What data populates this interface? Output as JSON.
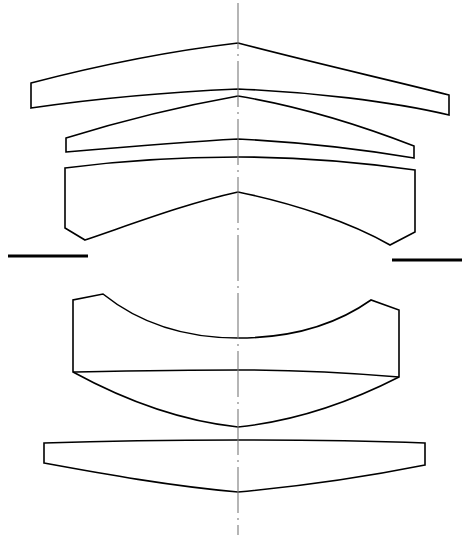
{
  "figure": {
    "type": "optical-system-cross-section",
    "width": 465,
    "height": 538,
    "background_color": "#ffffff",
    "line_color": "#000000",
    "axis_color": "#7a7a7a"
  },
  "optical_axis": {
    "name": "optical-axis",
    "orientation": "vertical",
    "style": "dash-dot",
    "x": 238,
    "y_start": 3,
    "y_end": 535,
    "color": "#7a7a7a",
    "stroke_width": 1.1,
    "dash_pattern": "46 5 2 5"
  },
  "aperture_stop": {
    "name": "aperture-stop",
    "label": "aperture stop blades",
    "color": "#000000",
    "stroke_width": 3.2,
    "blades": [
      {
        "side": "left",
        "x1": 8,
        "y1": 256,
        "x2": 88,
        "y2": 256
      },
      {
        "side": "right",
        "x1": 392,
        "y1": 260,
        "x2": 462,
        "y2": 260
      }
    ]
  },
  "elements": [
    {
      "id": 1,
      "name": "lens-element-1",
      "label": "Element 1 — meniscus, convex up",
      "group": "front-group",
      "edge_left_x": 31,
      "edge_right_x": 449,
      "apex_front_y": 43,
      "apex_rear_y": 89,
      "outline": "M 31,83 L 31,108 C 100,98 170,92 238,89 C 310,92 390,101 449,115 L 449,95 C 390,80 310,62 238,43 C 170,51 100,65 31,83 Z"
    },
    {
      "id": 2,
      "name": "lens-element-2",
      "label": "Element 2 — meniscus, convex up",
      "group": "front-group",
      "edge_left_x": 66,
      "edge_right_x": 414,
      "apex_front_y": 96,
      "apex_rear_y": 139,
      "outline": "M 66,138 L 66,152 C 124,147 182,142 238,139 C 298,142 360,149 414,158 L 414,146 C 360,125 298,106 238,96 C 182,106 124,120 66,138 Z"
    },
    {
      "id": 3,
      "name": "lens-element-3",
      "label": "Element 3 — thick meniscus with bevelled edges, convex up",
      "group": "front-group",
      "edge_left_x": 65,
      "edge_right_x": 415,
      "apex_front_y": 157,
      "apex_rear_y": 192,
      "bevel_left": {
        "x": 85,
        "y": 240
      },
      "bevel_right": {
        "x": 390,
        "y": 245
      },
      "outline": "M 65,168 L 65,228 L 85,240 C 135,223 188,203 238,192 C 292,203 350,222 390,245 L 415,232 L 415,170 C 358,162 296,157 238,157 C 178,157 118,161 65,168 Z"
    },
    {
      "id": 4,
      "name": "lens-element-4",
      "label": "Element 4 — cemented doublet, concave up / convex down",
      "group": "rear-group",
      "edge_left_x": 73,
      "edge_right_x": 399,
      "apex_front_y": 338,
      "apex_cement_y": 370,
      "apex_rear_y": 427,
      "bevel_left": {
        "x": 103,
        "y": 294
      },
      "bevel_right": {
        "x": 371,
        "y": 300
      },
      "outline": "M 73,300 L 73,372 C 128,402 182,421 238,427 C 296,421 350,402 399,377 L 399,310 L 371,300 C 330,329 285,338 238,338 C 190,338 144,327 103,294 Z",
      "cement_line": "M 73,372 C 128,371 182,370 238,370 C 296,370 350,373 399,377"
    },
    {
      "id": 5,
      "name": "lens-element-5",
      "label": "Element 5 — meniscus, convex down",
      "group": "rear-group",
      "edge_left_x": 44,
      "edge_right_x": 425,
      "apex_front_y": 440,
      "apex_rear_y": 492,
      "outline": "M 44,443 L 44,463 C 104,474 170,486 238,492 C 304,486 370,476 425,465 L 425,443 C 370,441 304,440 238,440 C 170,440 104,441 44,443 Z"
    }
  ]
}
